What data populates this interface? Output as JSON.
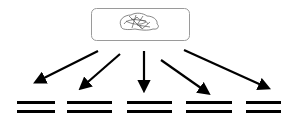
{
  "diagram": {
    "type": "one-to-many fan-out",
    "source": {
      "label": "",
      "icon": "brain-sketch-icon",
      "box": {
        "x": 91,
        "y": 8,
        "w": 98,
        "h": 32,
        "rx": 5,
        "stroke": "#9a9a9a"
      }
    },
    "arrows": [
      {
        "x1": 98,
        "y1": 51,
        "x2": 36,
        "y2": 82
      },
      {
        "x1": 120,
        "y1": 54,
        "x2": 81,
        "y2": 88
      },
      {
        "x1": 144,
        "y1": 51,
        "x2": 144,
        "y2": 90
      },
      {
        "x1": 161,
        "y1": 60,
        "x2": 208,
        "y2": 93
      },
      {
        "x1": 184,
        "y1": 50,
        "x2": 268,
        "y2": 88
      }
    ],
    "targets": [
      {
        "icon": "equals-bars-icon",
        "x": 17,
        "w": 38
      },
      {
        "icon": "equals-bars-icon",
        "x": 67,
        "w": 45
      },
      {
        "icon": "equals-bars-icon",
        "x": 127,
        "w": 45
      },
      {
        "icon": "equals-bars-icon",
        "x": 186,
        "w": 46
      },
      {
        "icon": "equals-bars-icon",
        "x": 246,
        "w": 35
      }
    ],
    "colors": {
      "stroke": "#000000",
      "box_border": "#9a9a9a",
      "sketch": "#555555"
    }
  }
}
